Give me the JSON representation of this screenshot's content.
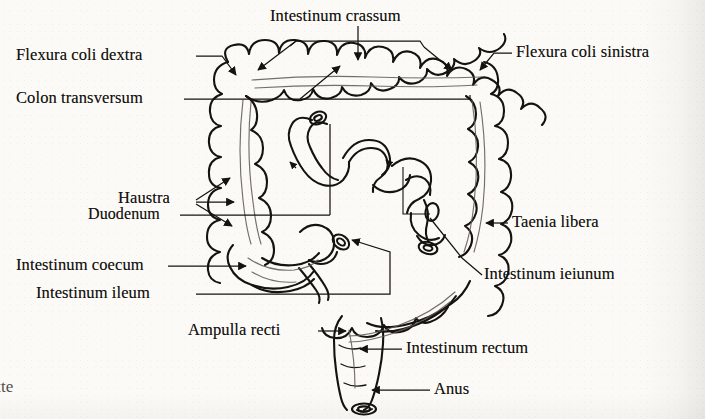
{
  "figure": {
    "kind": "anatomical-illustration",
    "style": "black-and-white line drawing on scanned book page",
    "background_color": "#fbfaf7",
    "ink_color": "#151310"
  },
  "labels": {
    "intestinum_crassum": "Intestinum crassum",
    "flexura_coli_dextra": "Flexura coli dextra",
    "flexura_coli_sinistra": "Flexura coli sinistra",
    "colon_transversum": "Colon transversum",
    "haustra": "Haustra",
    "duodenum": "Duodenum",
    "taenia_libera": "Taenia libera",
    "intestinum_coecum": "Intestinum coecum",
    "intestinum_ileum": "Intestinum ileum",
    "intestinum_ieiunum": "Intestinum ieiunum",
    "ampulla_recti": "Ampulla recti",
    "intestinum_rectum": "Intestinum rectum",
    "anus": "Anus"
  },
  "page_artifact": {
    "bottom_left_fragment": "tte"
  }
}
